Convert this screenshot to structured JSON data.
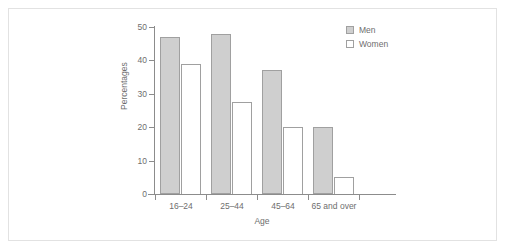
{
  "chart_data": {
    "type": "bar",
    "title": "",
    "subtitle": "",
    "xlabel": "Age",
    "ylabel": "Percentages",
    "categories": [
      "16–24",
      "25–44",
      "45–64",
      "65 and over"
    ],
    "series": [
      {
        "name": "Men",
        "values": [
          47,
          48,
          37,
          20
        ],
        "color": "#cfcfcf"
      },
      {
        "name": "Women",
        "values": [
          39,
          27.5,
          20,
          5
        ],
        "color": "#ffffff"
      }
    ],
    "ylim": [
      0,
      50
    ],
    "ytick_labels": [
      "0",
      "10",
      "20",
      "30",
      "40",
      "50"
    ],
    "ytick_values": [
      0,
      10,
      20,
      30,
      40,
      50
    ],
    "grid": false,
    "legend_position": "top-right"
  },
  "legend": {
    "entries": [
      {
        "label": "Men",
        "swatch": "filled-gray-square"
      },
      {
        "label": "Women",
        "swatch": "empty-white-square"
      }
    ]
  }
}
